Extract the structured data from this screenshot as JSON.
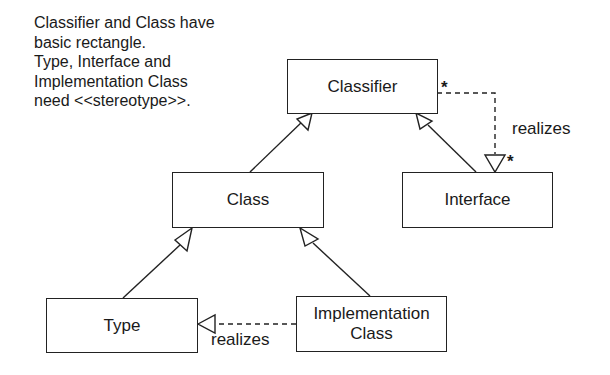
{
  "diagram": {
    "type": "UML class diagram",
    "note": {
      "lines": [
        "Classifier and Class have",
        "basic rectangle.",
        "Type, Interface and",
        "Implementation Class",
        "need <<stereotype>>."
      ]
    },
    "nodes": [
      {
        "id": "classifier",
        "label": "Classifier"
      },
      {
        "id": "class",
        "label": "Class"
      },
      {
        "id": "interface",
        "label": "Interface"
      },
      {
        "id": "type",
        "label": "Type"
      },
      {
        "id": "implementation_class",
        "label_lines": [
          "Implementation",
          "Class"
        ]
      }
    ],
    "edges": [
      {
        "from": "class",
        "to": "classifier",
        "kind": "generalization"
      },
      {
        "from": "interface",
        "to": "classifier",
        "kind": "generalization"
      },
      {
        "from": "type",
        "to": "class",
        "kind": "generalization"
      },
      {
        "from": "implementation_class",
        "to": "class",
        "kind": "generalization"
      },
      {
        "from": "classifier",
        "to": "interface",
        "kind": "realization",
        "label": "realizes",
        "source_multiplicity": "*",
        "target_multiplicity": "*"
      },
      {
        "from": "implementation_class",
        "to": "type",
        "kind": "realization",
        "label": "realizes"
      }
    ],
    "labels": {
      "realizes_top": "realizes",
      "realizes_bottom": "realizes",
      "mult_source": "*",
      "mult_target": "*"
    }
  }
}
